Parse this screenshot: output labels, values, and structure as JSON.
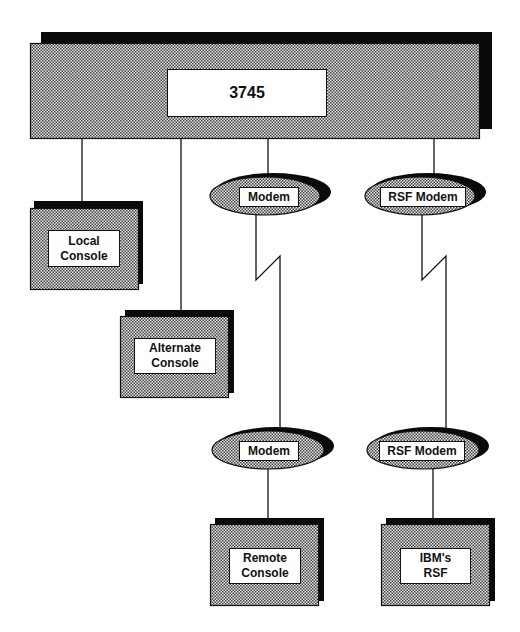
{
  "diagram": {
    "main_unit": {
      "label": "3745"
    },
    "consoles": {
      "local": {
        "line1": "Local",
        "line2": "Console"
      },
      "alternate": {
        "line1": "Alternate",
        "line2": "Console"
      },
      "remote": {
        "line1": "Remote",
        "line2": "Console"
      },
      "ibm_rsf": {
        "line1": "IBM's",
        "line2": "RSF"
      }
    },
    "modems": {
      "upper_modem": {
        "label": "Modem"
      },
      "upper_rsf_modem": {
        "label": "RSF Modem"
      },
      "lower_modem": {
        "label": "Modem"
      },
      "lower_rsf_modem": {
        "label": "RSF Modem"
      }
    },
    "connections": [
      {
        "from": "3745",
        "to": "Local Console",
        "type": "direct"
      },
      {
        "from": "3745",
        "to": "Alternate Console",
        "type": "direct"
      },
      {
        "from": "3745",
        "to": "Modem",
        "type": "direct"
      },
      {
        "from": "Modem",
        "to": "Modem",
        "type": "telephone-line"
      },
      {
        "from": "Modem",
        "to": "Remote Console",
        "type": "direct"
      },
      {
        "from": "3745",
        "to": "RSF Modem",
        "type": "direct"
      },
      {
        "from": "RSF Modem",
        "to": "RSF Modem",
        "type": "telephone-line"
      },
      {
        "from": "RSF Modem",
        "to": "IBM's RSF",
        "type": "direct"
      }
    ],
    "colors": {
      "line": "#111111",
      "shadow": "#0a0a0a",
      "fill_pattern_dot": "#555555",
      "fill_pattern_bg": "#d8d8d8",
      "label_bg": "#ffffff"
    }
  }
}
